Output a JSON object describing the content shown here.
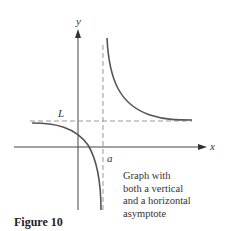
{
  "figure": {
    "label": "Figure 10",
    "caption_lines": [
      "Graph with",
      "both a vertical",
      "and a horizontal",
      "asymptote"
    ]
  },
  "axes": {
    "x_label": "x",
    "y_label": "y"
  },
  "annotations": {
    "horizontal_asymptote_label": "L",
    "vertical_asymptote_label": "a"
  },
  "colors": {
    "curve": "#555555",
    "axis": "#444444",
    "asymptote": "#999999"
  }
}
